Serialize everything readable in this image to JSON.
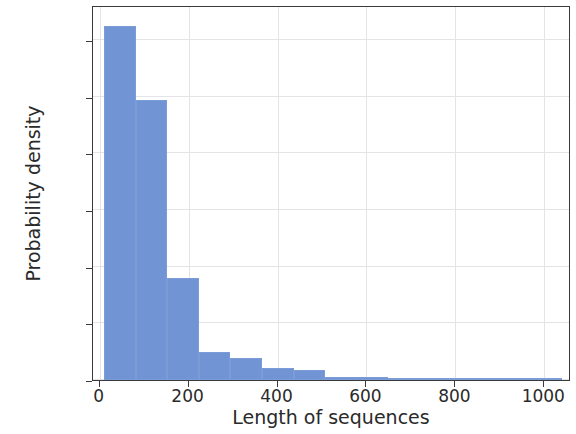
{
  "chart_data": {
    "type": "bar",
    "title": "",
    "subtitle": "",
    "xlabel": "Length of sequences",
    "ylabel": "Probability density",
    "xlim": [
      -15,
      1060
    ],
    "ylim": [
      0.0,
      0.00662
    ],
    "xticks": [
      0,
      200,
      400,
      600,
      800,
      1000
    ],
    "xtick_labels": [
      "0",
      "200",
      "400",
      "600",
      "800",
      "1000"
    ],
    "yticks": [
      0.0,
      0.001,
      0.002,
      0.003,
      0.004,
      0.005,
      0.006
    ],
    "ytick_labels": [
      "0.000",
      "0.001",
      "0.002",
      "0.003",
      "0.004",
      "0.005",
      "0.006"
    ],
    "grid": true,
    "legend": null,
    "bar_color": "#7094d4",
    "bin_width": 71,
    "bin_edges": [
      10,
      81,
      152,
      223,
      294,
      365,
      436,
      507,
      578,
      649,
      720,
      791,
      862,
      933,
      1004,
      1040
    ],
    "values": [
      0.00625,
      0.00495,
      0.0018,
      0.0005,
      0.00039,
      0.00022,
      0.00018,
      6e-05,
      5e-05,
      3e-05,
      2e-05,
      1e-05,
      5e-06,
      8e-06,
      1.2e-05
    ],
    "bars": [
      {
        "x0": 10,
        "x1": 81,
        "height": 0.00625
      },
      {
        "x0": 81,
        "x1": 152,
        "height": 0.00495
      },
      {
        "x0": 152,
        "x1": 223,
        "height": 0.0018
      },
      {
        "x0": 223,
        "x1": 294,
        "height": 0.0005
      },
      {
        "x0": 294,
        "x1": 365,
        "height": 0.00039
      },
      {
        "x0": 365,
        "x1": 436,
        "height": 0.00022
      },
      {
        "x0": 436,
        "x1": 507,
        "height": 0.00018
      },
      {
        "x0": 507,
        "x1": 578,
        "height": 6e-05
      },
      {
        "x0": 578,
        "x1": 649,
        "height": 5e-05
      },
      {
        "x0": 649,
        "x1": 720,
        "height": 3e-05
      },
      {
        "x0": 720,
        "x1": 791,
        "height": 2e-05
      },
      {
        "x0": 791,
        "x1": 862,
        "height": 1e-05
      },
      {
        "x0": 862,
        "x1": 933,
        "height": 5e-06
      },
      {
        "x0": 933,
        "x1": 1004,
        "height": 8e-06
      },
      {
        "x0": 1004,
        "x1": 1040,
        "height": 1.2e-05
      }
    ]
  }
}
